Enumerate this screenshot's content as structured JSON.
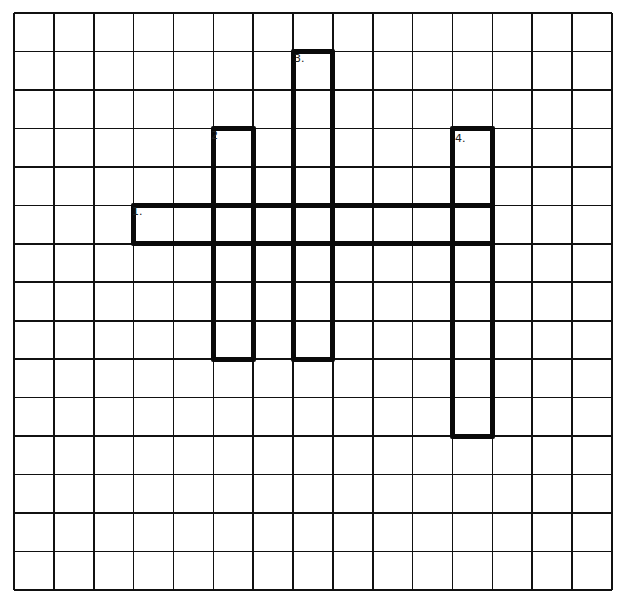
{
  "puzzle": {
    "type": "hand-drawn crossword grid",
    "grid_size": {
      "rows": 15,
      "cols": 15
    },
    "line_color": "#111111",
    "entry_border_color": "#0a0a0a",
    "background": "#ffffff",
    "entries": [
      {
        "number": "1.",
        "direction": "across",
        "row": 5,
        "col": 3,
        "length": 9
      },
      {
        "number": "2",
        "direction": "down",
        "row": 3,
        "col": 5,
        "length": 6
      },
      {
        "number": "3.",
        "direction": "down",
        "row": 1,
        "col": 7,
        "length": 8
      },
      {
        "number": "4.",
        "direction": "down",
        "row": 3,
        "col": 11,
        "length": 8
      }
    ]
  }
}
